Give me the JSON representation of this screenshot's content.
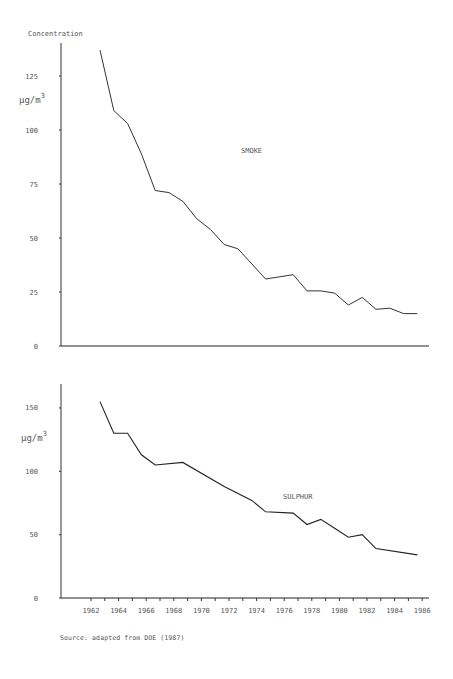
{
  "figure": {
    "y_header": "Concentration",
    "source": "Source:  adapted from DOE (1987)"
  },
  "chart_data": [
    {
      "type": "line",
      "title": "SMOKE",
      "xlabel": "",
      "ylabel": "µg/m³",
      "ylabel_header": "Concentration",
      "yticks": [
        0,
        25,
        50,
        75,
        100,
        125
      ],
      "ylim": [
        0,
        140
      ],
      "xlim": [
        1961,
        1986.5
      ],
      "grid": false,
      "legend": null,
      "x": [
        1963,
        1964,
        1965,
        1966,
        1967,
        1968,
        1969,
        1970,
        1971,
        1972,
        1973,
        1975,
        1977,
        1978,
        1979,
        1980,
        1981,
        1982,
        1983,
        1984,
        1985,
        1986
      ],
      "values": [
        137,
        109,
        103,
        89,
        72,
        71,
        67,
        59,
        54,
        47,
        45,
        31,
        33,
        25.5,
        25.5,
        24.5,
        19,
        22.5,
        17,
        17.5,
        15,
        15
      ]
    },
    {
      "type": "line",
      "title": "SULPHUR",
      "xlabel": "",
      "ylabel": "µg/m³",
      "yticks": [
        0,
        50,
        100,
        150
      ],
      "ylim": [
        0,
        165
      ],
      "xlim": [
        1961,
        1986.5
      ],
      "xticks": [
        "1962",
        "1964",
        "1966",
        "1968",
        "1970",
        "1972",
        "1974",
        "1976",
        "1978",
        "1980",
        "1982",
        "1984",
        "1986"
      ],
      "grid": false,
      "legend": null,
      "x": [
        1963,
        1964,
        1965,
        1966,
        1967,
        1969,
        1972,
        1974,
        1975,
        1977,
        1978,
        1979,
        1980,
        1981,
        1982,
        1983,
        1986
      ],
      "values": [
        155,
        130,
        130,
        113,
        105,
        107,
        88,
        77,
        68,
        67,
        58,
        62,
        55,
        48,
        50,
        39,
        34
      ]
    }
  ],
  "annotations": {
    "smoke_label": "SMOKE",
    "sulphur_label": "SULPHUR",
    "unit_main": "µg/m",
    "unit_sup": "3"
  }
}
